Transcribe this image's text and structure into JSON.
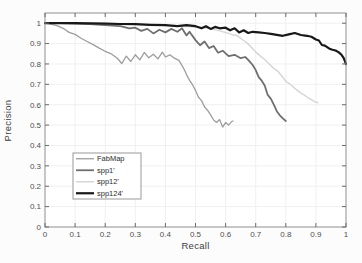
{
  "figure": {
    "background": "#fcfcfc",
    "plot_background": "#ffffff",
    "spine_color": "#8f8f8f",
    "grid_color": "#f0f0f0",
    "tick_color": "#6b6b6b",
    "tick_label_color": "#4f4f4f",
    "axis_label_color": "#3d3d3d",
    "legend_border_color": "#9a9a9a",
    "legend_background": "#ffffff",
    "legend_text_color": "#2b2b2b"
  },
  "chart_data": {
    "type": "line",
    "title": "",
    "xlabel": "Recall",
    "ylabel": "Precision",
    "xlim": [
      0,
      1
    ],
    "ylim": [
      0,
      1.05
    ],
    "grid": true,
    "xticks": [
      0,
      0.1,
      0.2,
      0.3,
      0.4,
      0.5,
      0.6,
      0.7,
      0.8,
      0.9,
      1
    ],
    "yticks": [
      0,
      0.1,
      0.2,
      0.3,
      0.4,
      0.5,
      0.6,
      0.7,
      0.8,
      0.9,
      1
    ],
    "xtick_labels": [
      "0",
      "0.1",
      "0.2",
      "0.3",
      "0.4",
      "0.5",
      "0.6",
      "0.7",
      "0.8",
      "0.9",
      "1"
    ],
    "ytick_labels": [
      "0",
      "0.1",
      "0.2",
      "0.3",
      "0.4",
      "0.5",
      "0.6",
      "0.7",
      "0.8",
      "0.9",
      "1"
    ],
    "legend": {
      "position": "lower-left-inside",
      "border": true
    },
    "series": [
      {
        "name": "FabMap",
        "color": "#9d9d9d",
        "width": 1.3,
        "points": [
          [
            0,
            1
          ],
          [
            0.02,
            0.995
          ],
          [
            0.04,
            0.988
          ],
          [
            0.06,
            0.975
          ],
          [
            0.08,
            0.955
          ],
          [
            0.1,
            0.945
          ],
          [
            0.12,
            0.926
          ],
          [
            0.14,
            0.91
          ],
          [
            0.16,
            0.895
          ],
          [
            0.18,
            0.878
          ],
          [
            0.2,
            0.862
          ],
          [
            0.22,
            0.85
          ],
          [
            0.24,
            0.828
          ],
          [
            0.255,
            0.802
          ],
          [
            0.27,
            0.838
          ],
          [
            0.285,
            0.812
          ],
          [
            0.3,
            0.845
          ],
          [
            0.315,
            0.82
          ],
          [
            0.33,
            0.856
          ],
          [
            0.345,
            0.83
          ],
          [
            0.36,
            0.848
          ],
          [
            0.375,
            0.825
          ],
          [
            0.39,
            0.858
          ],
          [
            0.4,
            0.834
          ],
          [
            0.415,
            0.845
          ],
          [
            0.43,
            0.828
          ],
          [
            0.445,
            0.818
          ],
          [
            0.46,
            0.78
          ],
          [
            0.47,
            0.748
          ],
          [
            0.48,
            0.72
          ],
          [
            0.49,
            0.698
          ],
          [
            0.5,
            0.67
          ],
          [
            0.51,
            0.637
          ],
          [
            0.52,
            0.62
          ],
          [
            0.53,
            0.59
          ],
          [
            0.54,
            0.573
          ],
          [
            0.55,
            0.55
          ],
          [
            0.56,
            0.525
          ],
          [
            0.57,
            0.513
          ],
          [
            0.58,
            0.527
          ],
          [
            0.59,
            0.49
          ],
          [
            0.6,
            0.512
          ],
          [
            0.61,
            0.5
          ],
          [
            0.62,
            0.517
          ],
          [
            0.625,
            0.52
          ]
        ]
      },
      {
        "name": "spp1'",
        "color": "#6f6f6f",
        "width": 1.8,
        "points": [
          [
            0,
            1
          ],
          [
            0.05,
            1
          ],
          [
            0.1,
            0.998
          ],
          [
            0.15,
            0.995
          ],
          [
            0.2,
            0.99
          ],
          [
            0.25,
            0.985
          ],
          [
            0.28,
            0.975
          ],
          [
            0.3,
            0.978
          ],
          [
            0.32,
            0.962
          ],
          [
            0.34,
            0.972
          ],
          [
            0.36,
            0.95
          ],
          [
            0.38,
            0.968
          ],
          [
            0.4,
            0.955
          ],
          [
            0.42,
            0.972
          ],
          [
            0.44,
            0.958
          ],
          [
            0.455,
            0.975
          ],
          [
            0.47,
            0.94
          ],
          [
            0.48,
            0.958
          ],
          [
            0.5,
            0.917
          ],
          [
            0.515,
            0.892
          ],
          [
            0.53,
            0.91
          ],
          [
            0.545,
            0.878
          ],
          [
            0.56,
            0.888
          ],
          [
            0.575,
            0.855
          ],
          [
            0.59,
            0.865
          ],
          [
            0.61,
            0.838
          ],
          [
            0.63,
            0.845
          ],
          [
            0.65,
            0.828
          ],
          [
            0.665,
            0.834
          ],
          [
            0.675,
            0.82
          ],
          [
            0.69,
            0.795
          ],
          [
            0.7,
            0.77
          ],
          [
            0.71,
            0.735
          ],
          [
            0.72,
            0.718
          ],
          [
            0.73,
            0.695
          ],
          [
            0.74,
            0.648
          ],
          [
            0.75,
            0.63
          ],
          [
            0.76,
            0.6
          ],
          [
            0.77,
            0.568
          ],
          [
            0.78,
            0.548
          ],
          [
            0.79,
            0.533
          ],
          [
            0.8,
            0.52
          ]
        ]
      },
      {
        "name": "spp12'",
        "color": "#d7d7d7",
        "width": 1.5,
        "points": [
          [
            0,
            1
          ],
          [
            0.1,
            1
          ],
          [
            0.2,
            0.998
          ],
          [
            0.3,
            0.995
          ],
          [
            0.35,
            0.992
          ],
          [
            0.4,
            0.988
          ],
          [
            0.45,
            0.985
          ],
          [
            0.5,
            0.982
          ],
          [
            0.53,
            0.978
          ],
          [
            0.56,
            0.97
          ],
          [
            0.58,
            0.962
          ],
          [
            0.6,
            0.955
          ],
          [
            0.62,
            0.945
          ],
          [
            0.64,
            0.938
          ],
          [
            0.655,
            0.92
          ],
          [
            0.67,
            0.905
          ],
          [
            0.68,
            0.89
          ],
          [
            0.7,
            0.858
          ],
          [
            0.715,
            0.84
          ],
          [
            0.73,
            0.822
          ],
          [
            0.745,
            0.8
          ],
          [
            0.76,
            0.778
          ],
          [
            0.775,
            0.762
          ],
          [
            0.79,
            0.735
          ],
          [
            0.8,
            0.715
          ],
          [
            0.815,
            0.7
          ],
          [
            0.83,
            0.68
          ],
          [
            0.845,
            0.663
          ],
          [
            0.86,
            0.648
          ],
          [
            0.875,
            0.633
          ],
          [
            0.89,
            0.62
          ],
          [
            0.9,
            0.612
          ],
          [
            0.907,
            0.61
          ]
        ]
      },
      {
        "name": "spp124'",
        "color": "#181818",
        "width": 2.2,
        "points": [
          [
            0,
            1
          ],
          [
            0.1,
            1
          ],
          [
            0.2,
            0.998
          ],
          [
            0.25,
            0.996
          ],
          [
            0.3,
            0.995
          ],
          [
            0.35,
            0.992
          ],
          [
            0.4,
            0.99
          ],
          [
            0.44,
            0.985
          ],
          [
            0.47,
            0.99
          ],
          [
            0.5,
            0.985
          ],
          [
            0.52,
            0.975
          ],
          [
            0.535,
            0.985
          ],
          [
            0.55,
            0.972
          ],
          [
            0.565,
            0.982
          ],
          [
            0.58,
            0.975
          ],
          [
            0.6,
            0.978
          ],
          [
            0.615,
            0.965
          ],
          [
            0.63,
            0.975
          ],
          [
            0.645,
            0.955
          ],
          [
            0.66,
            0.965
          ],
          [
            0.675,
            0.952
          ],
          [
            0.69,
            0.958
          ],
          [
            0.71,
            0.955
          ],
          [
            0.73,
            0.952
          ],
          [
            0.75,
            0.948
          ],
          [
            0.77,
            0.943
          ],
          [
            0.79,
            0.938
          ],
          [
            0.81,
            0.945
          ],
          [
            0.83,
            0.952
          ],
          [
            0.85,
            0.942
          ],
          [
            0.87,
            0.938
          ],
          [
            0.885,
            0.933
          ],
          [
            0.9,
            0.92
          ],
          [
            0.91,
            0.915
          ],
          [
            0.92,
            0.893
          ],
          [
            0.93,
            0.89
          ],
          [
            0.945,
            0.875
          ],
          [
            0.955,
            0.87
          ],
          [
            0.965,
            0.866
          ],
          [
            0.975,
            0.858
          ],
          [
            0.985,
            0.845
          ],
          [
            0.992,
            0.83
          ],
          [
            0.996,
            0.815
          ],
          [
            1,
            0.8
          ]
        ]
      }
    ]
  }
}
